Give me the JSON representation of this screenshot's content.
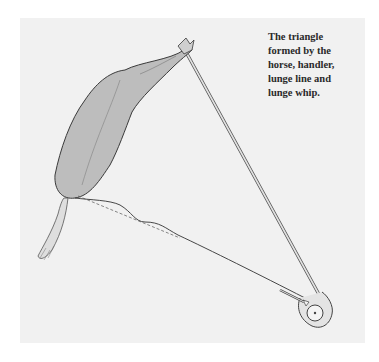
{
  "caption": {
    "lines": [
      "The triangle",
      "formed by the",
      "horse, handler,",
      "lunge line and",
      "lunge whip."
    ]
  },
  "illustration": {
    "subjects": [
      "horse",
      "handler",
      "lunge-line",
      "lunge-whip"
    ],
    "colors": {
      "panel": "#f1f1f1",
      "horse_fill": "#bdbdbd",
      "outline": "#444444",
      "whip": "#d9d9d9"
    }
  }
}
